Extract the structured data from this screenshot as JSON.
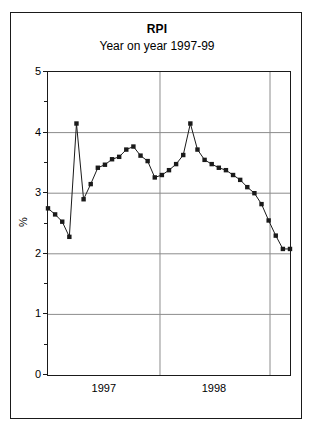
{
  "chart_data": {
    "type": "line",
    "title": "RPI",
    "subtitle": "Year on year 1997-99",
    "xlabel": "",
    "ylabel": "%",
    "ylim": [
      0,
      5
    ],
    "ytick_values": [
      0,
      1,
      2,
      3,
      4,
      5
    ],
    "ytick_labels": [
      "0",
      "1",
      "2",
      "3",
      "4",
      "5"
    ],
    "yminor_values": [
      0.5,
      1.5,
      2.5,
      3.5,
      4.5
    ],
    "xtick_labels": [
      "1997",
      "1998"
    ],
    "grid": "horizontal-major-only",
    "legend": "none",
    "marker": "filled-square",
    "line_color": "#1a1a1a",
    "marker_color": "#1a1a1a",
    "grid_color": "#8c8c8c",
    "axis_color": "#1a1a1a",
    "background": "#ffffff",
    "x": [
      0,
      1,
      2,
      3,
      4,
      5,
      6,
      7,
      8,
      9,
      10,
      11,
      12,
      13,
      14,
      15,
      16,
      17,
      18,
      19,
      20,
      21,
      22,
      23,
      24,
      25,
      26,
      27,
      28,
      29,
      30,
      31,
      32,
      33,
      34
    ],
    "values": [
      2.75,
      2.65,
      2.53,
      2.28,
      4.15,
      2.9,
      3.15,
      3.42,
      3.47,
      3.56,
      3.6,
      3.72,
      3.77,
      3.62,
      3.53,
      3.26,
      3.3,
      3.38,
      3.48,
      3.63,
      4.15,
      3.72,
      3.55,
      3.48,
      3.42,
      3.38,
      3.3,
      3.22,
      3.1,
      3.0,
      2.82,
      2.55,
      2.3,
      2.08,
      2.08
    ],
    "xtick_positions_frac": [
      0.0,
      0.4628,
      0.9174
    ],
    "xtick_label_positions_frac": [
      0.235,
      0.69
    ]
  },
  "figure": {
    "has_outer_border": true,
    "has_plot_border": true
  }
}
